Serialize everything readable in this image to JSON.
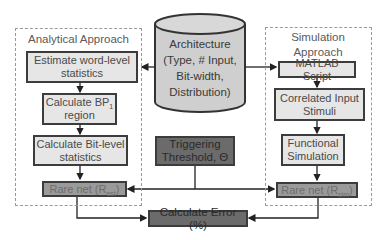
{
  "diagram": {
    "analytical": {
      "title": "Analytical Approach",
      "estimate": "Estimate word-level statistics",
      "bp_main": "Calculate BP",
      "bp_sub": "1",
      "bp_suffix": "region",
      "bitlevel": "Calculate Bit-level statistics",
      "rare_main": "Rare net (R",
      "rare_sub": "est",
      "rare_close": ")"
    },
    "architecture": {
      "line1": "Architecture",
      "line2": "(Type, # Input,",
      "line3": "Bit-width,",
      "line4": "Distribution)"
    },
    "simulation": {
      "title": "Simulation Approach",
      "matlab": "MATLAB Script",
      "stimuli": "Correlated Input Stimuli",
      "functional": "Functional Simulation",
      "rare_main": "Rare net (R",
      "rare_sub": "sim",
      "rare_close": ")"
    },
    "threshold": "Triggering Threshold, Θ",
    "error": "Calculate Error (%)",
    "colors": {
      "light_box": "#e6e6e6",
      "mid_box": "#9a9a9a",
      "dark_box": "#6b6b6b",
      "border": "#3c3c3c",
      "dashed": "#9a9a9a"
    }
  }
}
